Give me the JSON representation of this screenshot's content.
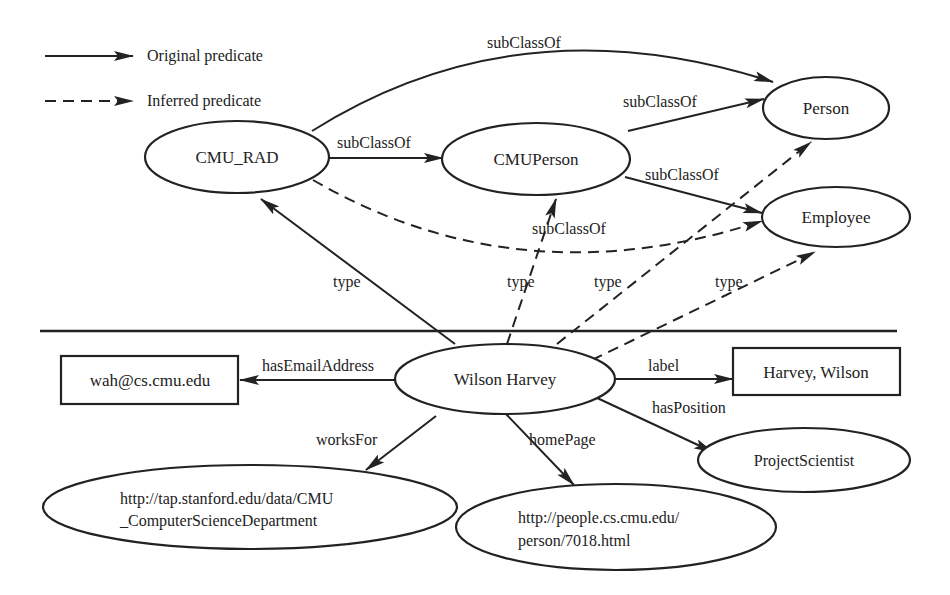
{
  "legend": {
    "original": "Original predicate",
    "inferred": "Inferred predicate"
  },
  "nodes": {
    "cmu_rad": "CMU_RAD",
    "cmu_person": "CMUPerson",
    "person": "Person",
    "employee": "Employee",
    "wilson_harvey": "Wilson Harvey",
    "email": "wah@cs.cmu.edu",
    "label_value": "Harvey, Wilson",
    "project_scientist": "ProjectScientist",
    "cs_department": {
      "line1": "http://tap.stanford.edu/data/CMU",
      "line2": "_ComputerScienceDepartment"
    },
    "homepage": {
      "line1": "http://people.cs.cmu.edu/",
      "line2": "person/7018.html"
    }
  },
  "edges": {
    "rad_person": "subClassOf",
    "rad_cmuperson": "subClassOf",
    "cmuperson_person": "subClassOf",
    "cmuperson_employee": "subClassOf",
    "rad_employee_inferred": "subClassOf",
    "wh_rad": "type",
    "wh_cmuperson": "type",
    "wh_person": "type",
    "wh_employee": "type",
    "email": "hasEmailAddress",
    "label": "label",
    "position": "hasPosition",
    "works_for": "worksFor",
    "home_page": "homePage"
  },
  "colors": {
    "ink": "#222222",
    "background": "#ffffff"
  }
}
